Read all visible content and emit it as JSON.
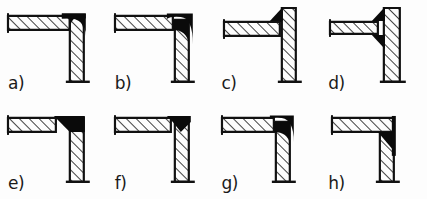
{
  "figure": {
    "colors": {
      "background": "#fdfdfd",
      "outline": "#111111",
      "hatch": "#111111",
      "weld": "#0a0a0a",
      "label": "#1a1a1a"
    },
    "layout": {
      "rows": 2,
      "columns": 4,
      "width": 427,
      "height": 199
    }
  },
  "panels": [
    {
      "id": "a",
      "label": "a)",
      "row": 1,
      "column": 1,
      "weld_style": "rounded-outer-corner-fillet",
      "weld_position": "outer-top-right",
      "horizontal_member": "overlapping-top",
      "vertical_member": "below-horizontal",
      "hatching": "diagonal-45-up-right"
    },
    {
      "id": "b",
      "label": "b)",
      "row": 1,
      "column": 2,
      "weld_style": "rounded-outer-corner-fillet-deep",
      "weld_position": "outer-top-right-extended",
      "horizontal_member": "overlapping-top",
      "vertical_member": "below-horizontal",
      "hatching": "diagonal-45-up-right"
    },
    {
      "id": "c",
      "label": "c)",
      "row": 1,
      "column": 3,
      "weld_style": "triangular-fillet",
      "weld_position": "inner-top-left-of-vertical",
      "horizontal_member": "butted-to-vertical",
      "vertical_member": "extends-above",
      "hatching": "diagonal-45-up-right"
    },
    {
      "id": "d",
      "label": "d)",
      "row": 1,
      "column": 4,
      "weld_style": "double-triangular-fillet",
      "weld_position": "above-and-below-horizontal",
      "horizontal_member": "butted-to-vertical",
      "vertical_member": "extends-above",
      "hatching": "diagonal-45-up-right"
    },
    {
      "id": "e",
      "label": "e)",
      "row": 2,
      "column": 1,
      "weld_style": "wedge-in-horizontal-member",
      "weld_position": "inner-corner-wide",
      "horizontal_member": "overlapping-top",
      "vertical_member": "below-horizontal",
      "hatching": "diagonal-45-up-right"
    },
    {
      "id": "f",
      "label": "f)",
      "row": 2,
      "column": 2,
      "weld_style": "small-triangular-wedge",
      "weld_position": "top-of-corner",
      "horizontal_member": "overlapping-top",
      "vertical_member": "below-horizontal",
      "hatching": "diagonal-45-up-right"
    },
    {
      "id": "g",
      "label": "g)",
      "row": 2,
      "column": 3,
      "weld_style": "rounded-quarter-corner-fillet",
      "weld_position": "outer-top-right-rounded",
      "horizontal_member": "overlapping-top",
      "vertical_member": "below-horizontal",
      "hatching": "diagonal-45-up-right"
    },
    {
      "id": "h",
      "label": "h)",
      "row": 2,
      "column": 4,
      "weld_style": "solid-black-corner-block",
      "weld_position": "inner-corner-below-horizontal",
      "horizontal_member": "overlapping-top",
      "vertical_member": "below-horizontal",
      "hatching": "diagonal-45-up-right"
    }
  ]
}
